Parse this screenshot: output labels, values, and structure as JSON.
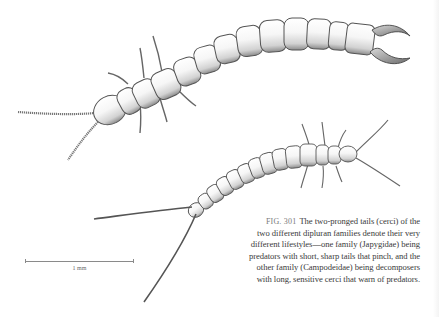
{
  "figure": {
    "number_label": "FIG. 301",
    "caption_lines": [
      "The two-pronged tails (cerci) of the",
      "two different dipluran families denote their very",
      "different lifestyles—one family (Japygidae) being",
      "predators with short, sharp tails that pinch, and the",
      "other family (Campodeidae) being decomposers",
      "with long, sensitive cerci that warn of predators."
    ]
  },
  "scale_bar": {
    "label": "1 mm"
  },
  "illustrations": [
    {
      "name": "Japygidae dipluran",
      "description": "segmented body with pincer-like cerci, beaded antennae",
      "position": "upper"
    },
    {
      "name": "Campodeidae dipluran",
      "description": "slender segmented body with long filamentous cerci",
      "position": "lower"
    }
  ],
  "colors": {
    "background": "#ffffff",
    "ink": "#3a3a3a",
    "figure_label": "#7a7a7a",
    "body_fill": "#f4f4f4",
    "body_shade": "#9a9a9a"
  }
}
